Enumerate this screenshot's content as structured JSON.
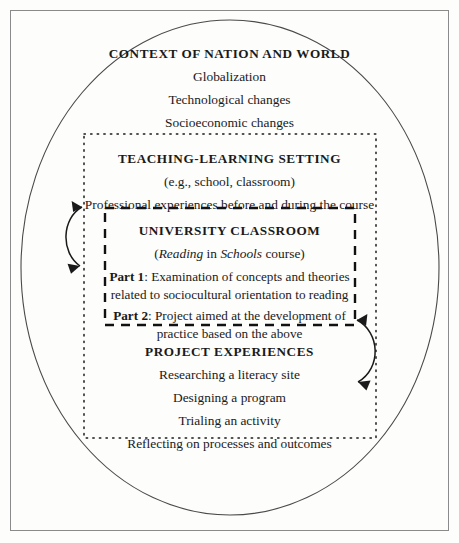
{
  "figure": {
    "background_color": "#fdfdfc",
    "line_color": "#1a1a1a",
    "frame_color": "#8a8a8a"
  },
  "context_section": {
    "heading": "CONTEXT OF NATION AND WORLD",
    "lines": [
      "Globalization",
      "Technological changes",
      "Socioeconomic changes"
    ]
  },
  "setting_section": {
    "heading": "TEACHING-LEARNING SETTING",
    "subtitle": "(e.g., school, classroom)",
    "lines": [
      "Professional experiences before and during the course"
    ]
  },
  "classroom_section": {
    "heading": "UNIVERSITY CLASSROOM",
    "course_open_paren": "(",
    "course_title_italic_1": "Reading",
    "course_title_roman_1": " in ",
    "course_title_italic_2": "Schools",
    "course_title_roman_2": " course)",
    "part1_label": "Part 1",
    "part1_colon": ": ",
    "part1_text_line1": "Examination of concepts and theories",
    "part1_text_line2": "related to sociocultural orientation to reading",
    "part2_label": "Part 2",
    "part2_colon": ": ",
    "part2_text_line1": "Project aimed at the development of",
    "part2_text_line2": "practice based on the above"
  },
  "project_section": {
    "heading": "PROJECT EXPERIENCES",
    "lines": [
      "Researching a literacy site",
      "Designing a program",
      "Trialing an activity",
      "Reflecting on processes and outcomes"
    ]
  },
  "connectors": {
    "left_arrow_name": "bidirectional arrow between teaching-learning setting and university classroom",
    "right_arrow_name": "bidirectional arrow between university classroom and project experiences"
  }
}
